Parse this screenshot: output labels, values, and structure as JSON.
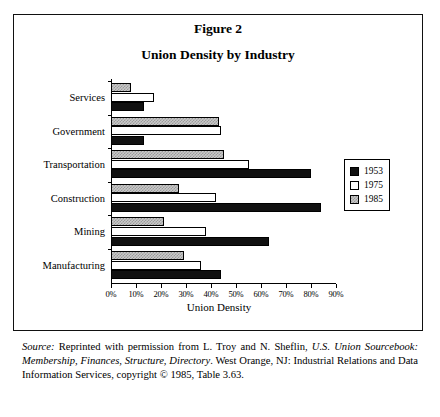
{
  "figure": {
    "number_label": "Figure 2",
    "title": "Union Density by Industry"
  },
  "chart_data": {
    "type": "bar",
    "orientation": "horizontal",
    "title": "Union Density by Industry",
    "xlabel": "Union Density",
    "ylabel": "",
    "xlim": [
      0,
      90
    ],
    "xticks": [
      0,
      10,
      20,
      30,
      40,
      50,
      60,
      70,
      80,
      90
    ],
    "xtick_labels": [
      "0%",
      "10%",
      "20%",
      "30%",
      "40%",
      "50%",
      "60%",
      "70%",
      "80%",
      "90%"
    ],
    "grid": false,
    "legend_position": "right",
    "categories": [
      "Services",
      "Government",
      "Transportation",
      "Construction",
      "Mining",
      "Manufacturing"
    ],
    "series": [
      {
        "name": "1953",
        "color": "#111111",
        "values": [
          13,
          13,
          80,
          84,
          63,
          44
        ]
      },
      {
        "name": "1975",
        "color": "#ffffff",
        "values": [
          17,
          44,
          55,
          42,
          38,
          36
        ]
      },
      {
        "name": "1985",
        "color": "#c9c9c9",
        "values": [
          8,
          43,
          45,
          27,
          21,
          29
        ]
      }
    ]
  },
  "legend": {
    "entries": [
      {
        "label": "1953",
        "swatch": "y1953"
      },
      {
        "label": "1975",
        "swatch": "y1975"
      },
      {
        "label": "1985",
        "swatch": "y1985"
      }
    ]
  },
  "source_note": {
    "label": "Source:",
    "text_1": " Reprinted with permission from L. Troy and N. Sheflin, ",
    "italic_title": "U.S. Union Sourcebook: Membership, Finances, Structure, Directory",
    "text_2": ". West Orange, NJ: Industrial Relations and Data Information Services, copyright © 1985, Table 3.63."
  }
}
